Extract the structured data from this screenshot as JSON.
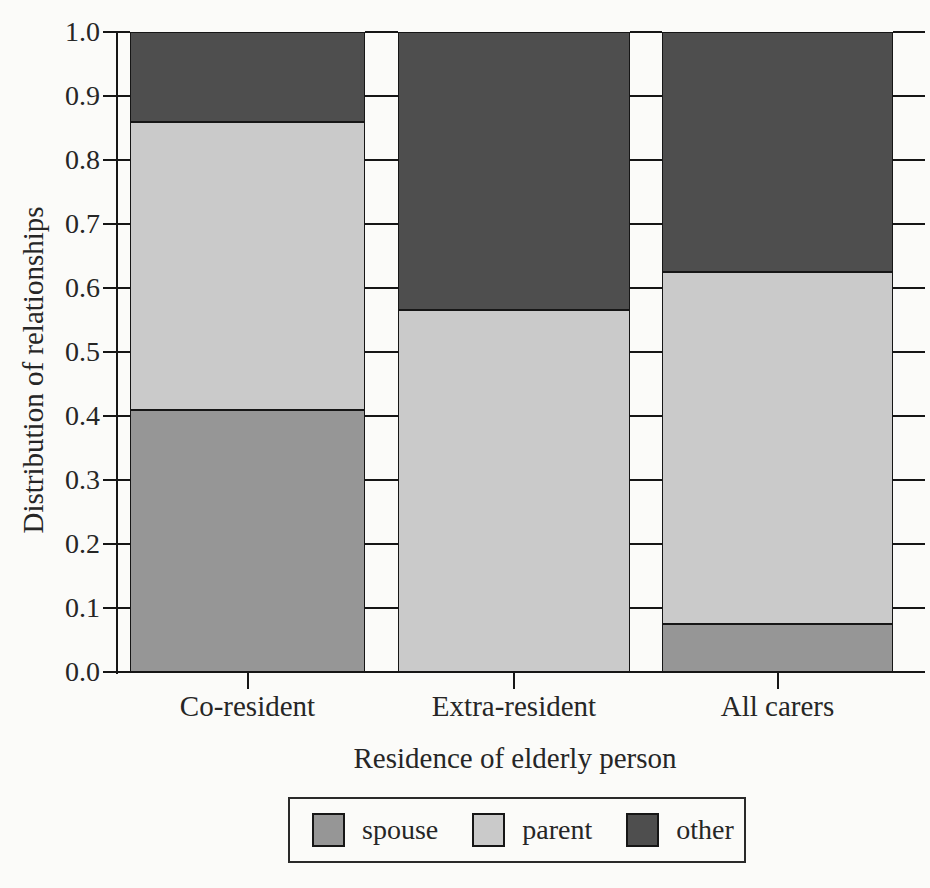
{
  "chart_data": {
    "type": "bar",
    "stacked": true,
    "categories": [
      "Co-resident",
      "Extra-resident",
      "All carers"
    ],
    "series": [
      {
        "name": "spouse",
        "color": "#969696",
        "values": [
          0.41,
          0.0,
          0.075
        ]
      },
      {
        "name": "parent",
        "color": "#cacaca",
        "values": [
          0.45,
          0.565,
          0.55
        ]
      },
      {
        "name": "other",
        "color": "#4e4e4e",
        "values": [
          0.14,
          0.435,
          0.375
        ]
      }
    ],
    "xlabel": "Residence of elderly person",
    "ylabel": "Distribution of relationships",
    "ylim": [
      0.0,
      1.0
    ],
    "yticks": [
      "0.0",
      "0.1",
      "0.2",
      "0.3",
      "0.4",
      "0.5",
      "0.6",
      "0.7",
      "0.8",
      "0.9",
      "1.0"
    ],
    "legend_position": "bottom",
    "grid": "tick marks cross axis and inter-bar gaps; no full gridlines"
  }
}
